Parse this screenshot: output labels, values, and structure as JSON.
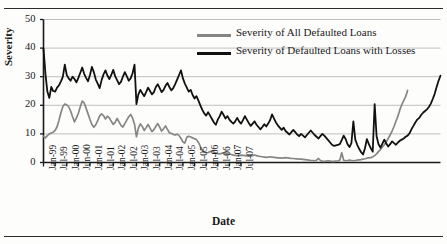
{
  "figure": {
    "y_axis_title": "Severity",
    "x_axis_title": "Date",
    "legend": [
      {
        "label": "Severity of All Defaulted Loans",
        "color": "#868686"
      },
      {
        "label": "Severity of Defaulted Loans with Losses",
        "color": "#111111"
      }
    ]
  },
  "chart_data": {
    "type": "line",
    "title": "",
    "xlabel": "Date",
    "ylabel": "Severity",
    "ylim": [
      0,
      50
    ],
    "yticks": [
      0,
      10,
      20,
      30,
      40,
      50
    ],
    "grid": "horizontal",
    "legend_position": "upper-right-inside",
    "x_tick_labels": [
      "Jan-99",
      "Jul-99",
      "Jan-00",
      "Jun-00",
      "Jan-01",
      "Jul-01",
      "Jan-02",
      "Jul-02",
      "Jan-03",
      "Jul-03",
      "Jan-04",
      "Jul-04",
      "Jan-05",
      "Jul-05",
      "Jan-06",
      "Jul-06",
      "Jan-07",
      "Jul-07"
    ],
    "x_tick_step_months": 6,
    "x_start": "Jan-99",
    "x_end": "Oct-07",
    "series": [
      {
        "name": "Severity of All Defaulted Loans",
        "color": "#868686",
        "values": [
          9.2,
          8.6,
          9.4,
          10.0,
          10.3,
          10.6,
          11.2,
          12.5,
          14.8,
          17.4,
          19.6,
          20.4,
          20.2,
          19.5,
          18.0,
          16.0,
          14.2,
          15.6,
          17.2,
          19.5,
          21.5,
          20.8,
          19.0,
          17.0,
          15.0,
          13.3,
          12.3,
          13.2,
          14.6,
          16.3,
          17.0,
          16.4,
          15.2,
          16.2,
          15.6,
          14.4,
          13.3,
          14.0,
          15.4,
          14.2,
          13.0,
          12.4,
          13.6,
          14.8,
          16.0,
          16.8,
          15.5,
          13.4,
          9.0,
          12.0,
          13.5,
          12.6,
          11.2,
          12.2,
          13.3,
          12.0,
          10.8,
          11.5,
          12.6,
          13.6,
          12.4,
          11.0,
          11.8,
          12.8,
          11.6,
          10.4,
          10.2,
          9.8,
          9.6,
          9.9,
          9.4,
          8.4,
          7.2,
          6.8,
          8.8,
          9.2,
          8.9,
          8.6,
          8.3,
          8.0,
          7.0,
          5.6,
          4.4,
          3.6,
          3.4,
          3.5,
          3.8,
          4.0,
          3.6,
          3.3,
          3.1,
          3.0,
          3.2,
          3.4,
          3.2,
          3.0,
          2.9,
          2.8,
          2.6,
          2.5,
          2.4,
          2.5,
          2.6,
          2.5,
          2.4,
          2.3,
          2.2,
          2.3,
          2.4,
          2.6,
          2.4,
          2.2,
          2.1,
          2.0,
          1.9,
          1.8,
          1.9,
          2.0,
          1.9,
          1.8,
          1.7,
          1.6,
          1.6,
          1.5,
          1.6,
          1.7,
          1.6,
          1.5,
          1.4,
          1.4,
          1.3,
          1.3,
          1.2,
          1.2,
          1.1,
          1.0,
          0.9,
          0.8,
          0.7,
          0.7,
          0.6,
          0.8,
          1.4,
          0.7,
          0.5,
          0.4,
          0.5,
          0.6,
          0.5,
          0.4,
          0.4,
          0.5,
          0.6,
          0.8,
          3.4,
          0.8,
          0.6,
          0.7,
          0.8,
          0.7,
          0.6,
          0.7,
          0.8,
          0.9,
          1.0,
          1.2,
          1.3,
          1.5,
          1.6,
          1.7,
          2.0,
          2.4,
          3.0,
          3.8,
          4.6,
          5.4,
          6.2,
          7.2,
          8.4,
          9.6,
          11.0,
          12.6,
          14.4,
          16.2,
          18.4,
          20.2,
          21.6,
          23.0,
          25.2
        ]
      },
      {
        "name": "Severity of Defaulted Loans with Losses",
        "color": "#111111",
        "values": [
          39.8,
          31.0,
          24.8,
          22.6,
          26.4,
          25.0,
          24.8,
          26.2,
          27.0,
          28.4,
          30.0,
          34.2,
          30.6,
          29.4,
          28.6,
          30.0,
          29.2,
          28.0,
          29.6,
          31.4,
          33.2,
          31.0,
          29.6,
          28.4,
          30.6,
          33.4,
          31.6,
          29.0,
          27.6,
          26.0,
          28.8,
          30.8,
          32.2,
          30.4,
          29.2,
          30.6,
          32.4,
          30.2,
          28.8,
          27.4,
          28.2,
          30.0,
          31.6,
          30.2,
          28.6,
          29.4,
          31.2,
          34.2,
          20.4,
          23.8,
          25.4,
          24.2,
          23.2,
          24.6,
          26.2,
          25.0,
          23.8,
          24.6,
          26.4,
          27.4,
          26.0,
          24.6,
          25.4,
          26.8,
          27.8,
          26.4,
          25.2,
          26.0,
          27.4,
          29.0,
          30.6,
          32.2,
          29.4,
          27.6,
          26.2,
          24.8,
          25.4,
          23.6,
          22.4,
          23.2,
          21.6,
          20.0,
          18.4,
          17.2,
          16.4,
          17.6,
          16.4,
          15.2,
          14.0,
          13.2,
          15.0,
          16.2,
          17.8,
          16.6,
          15.4,
          16.2,
          15.0,
          14.2,
          13.6,
          14.4,
          15.6,
          14.4,
          13.6,
          14.8,
          16.2,
          15.0,
          13.8,
          12.8,
          13.6,
          14.4,
          13.2,
          12.4,
          11.6,
          12.4,
          13.4,
          12.6,
          13.6,
          14.8,
          16.8,
          15.4,
          14.0,
          13.0,
          12.2,
          11.4,
          12.2,
          11.0,
          10.4,
          9.8,
          10.6,
          11.4,
          10.6,
          9.8,
          9.2,
          10.0,
          9.4,
          8.8,
          9.6,
          10.4,
          11.2,
          10.4,
          9.6,
          9.0,
          8.4,
          9.2,
          10.0,
          9.4,
          8.6,
          7.8,
          7.0,
          6.2,
          5.8,
          6.0,
          6.2,
          6.4,
          7.8,
          9.4,
          8.2,
          6.4,
          5.4,
          6.8,
          14.4,
          8.0,
          6.2,
          4.8,
          3.6,
          2.8,
          5.0,
          8.2,
          6.4,
          5.0,
          3.8,
          20.4,
          9.2,
          6.4,
          5.2,
          6.6,
          8.0,
          6.6,
          5.6,
          6.4,
          7.4,
          6.8,
          6.2,
          7.0,
          7.6,
          8.0,
          8.4,
          9.0,
          9.4,
          10.2,
          11.6,
          12.8,
          14.0,
          15.0,
          15.6,
          16.6,
          17.4,
          18.0,
          18.6,
          19.4,
          20.6,
          22.2,
          24.0,
          26.4,
          28.6,
          30.4
        ]
      }
    ]
  }
}
